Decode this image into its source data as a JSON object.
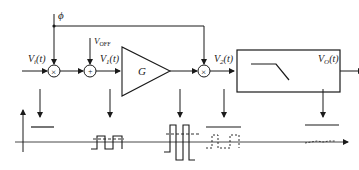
{
  "diagram": {
    "colors": {
      "line": "#1a1a1a",
      "background": "#ffffff"
    },
    "labels": {
      "phi": "ϕ",
      "vin": "V",
      "vin_sub": "i",
      "vin_t": "(t)",
      "voff": "V",
      "voff_sub": "OFF",
      "v1": "V",
      "v1_sub": "1",
      "v1_t": "(t)",
      "gain": "G",
      "v2": "V",
      "v2_sub": "2",
      "v2_t": "(t)",
      "vo": "V",
      "vo_sub": "O",
      "vo_t": "(t)",
      "mixer1_symbol": "×",
      "adder_symbol": "+",
      "mixer2_symbol": "×"
    },
    "blocks": [
      {
        "id": "mixer1",
        "type": "multiplier"
      },
      {
        "id": "adder",
        "type": "summer"
      },
      {
        "id": "amplifier",
        "type": "gain",
        "label": "G"
      },
      {
        "id": "mixer2",
        "type": "multiplier"
      },
      {
        "id": "lpf",
        "type": "low-pass-filter"
      }
    ],
    "waveforms": [
      {
        "id": "wf-input",
        "desc": "DC level"
      },
      {
        "id": "wf-v1",
        "desc": "small square wave with offset (dashed)"
      },
      {
        "id": "wf-amp",
        "desc": "large amplified square wave with dashed offset"
      },
      {
        "id": "wf-v2",
        "desc": "demodulated DC level with dashed chopped offset"
      },
      {
        "id": "wf-out",
        "desc": "DC output level with small residual ripple"
      }
    ]
  }
}
